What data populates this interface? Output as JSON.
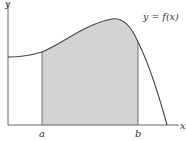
{
  "figure": {
    "type": "definite-integral-area",
    "curve_label": "y = f(x)",
    "x_axis_label": "x",
    "y_axis_label": "y",
    "lower_bound_label": "a",
    "upper_bound_label": "b",
    "colors": {
      "shade": "#d3d3d3",
      "curve": "#444444",
      "axis": "#555555",
      "background": "#ffffff"
    }
  }
}
